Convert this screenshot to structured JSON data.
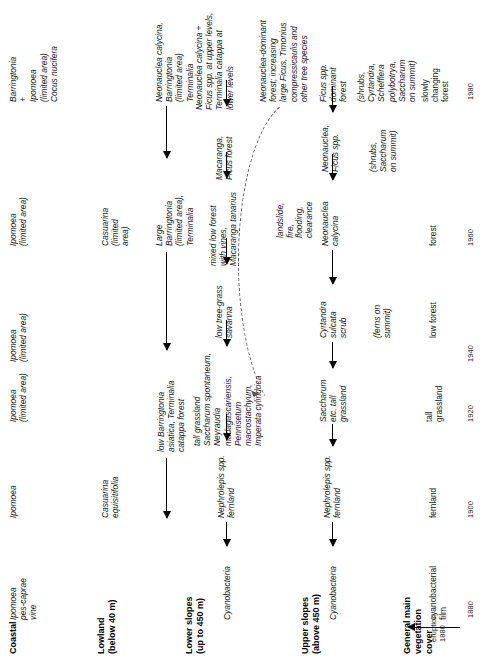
{
  "figure": {
    "orientation": "rotated-90ccw",
    "zone_headers": [
      "Coastal",
      "Lowland\n(below 40 m)",
      "Lower slopes\n(up to 450 m)",
      "Upper slopes\n(above 450 m)",
      "General main\nvegetation\ncover"
    ],
    "years": [
      "1880",
      "1900",
      "1920",
      "1940",
      "1960",
      "1980"
    ],
    "eruption_label": "eruption\n1880"
  },
  "cells": {
    "coastal_1880": "Ipomoea\npes-caprae\nvine",
    "coastal_1900": "Ipomoea",
    "coastal_1920": "Ipomoea\n(limited area)",
    "coastal_1940": "Ipomoea\n(limited area)",
    "coastal_1960": "Ipomoea\n(limited area)",
    "coastal_1980": "Barringtonia\n+\nIpomoea\n(limited area)\nCocus nucifera",
    "lowland_1900": "Casuarina\nequisitifolia",
    "lowland_1920": "low Barringtonia\nasiatica, Terminalia\ncatappa forest",
    "lowland_1960": "Casuarina\n(limited\narea)",
    "lowland_1960b": "Large\nBarringtonia\n(limited area),\nTerminalia",
    "lowland_1980": "Neonauclea calycina,\nBarringtonia\n(limited area)\nTerminalia",
    "lower_1880": "Cyanobacteria",
    "lower_1900": "Nephrolepis spp.\nfernland",
    "lower_1920": "tall grassland\nSaccharum spontaneum,\nNeyraudia\nmadagascariensis,\nPennisetum\nmacrostachyum,\nImperata cylindrica",
    "lower_1940": "low tree-grass\nsavanna",
    "lower_1950": "mixed low forest\nwith vines,\nMacaranga tanarius",
    "lower_1960": "Macaranga,\nFicus forest",
    "lower_1970": "Neonauclea calycina +\nFicus spp. at upper levels,\nTerminalia catappa at\nlower levels",
    "lower_1980": "Neonauclea-dominant\nforest; increasing\nlarge Ficus, Timonius\ncompressicaulis and\nother tree species",
    "upper_1880": "Cyanobacteria",
    "upper_1900": "Nephrolepis spp.\nfernland",
    "upper_1920": "Saccharum\netc. tall\ngrassland",
    "upper_1940": "Cyrtandra\nsulcata\nscrub",
    "upper_1960": "Neonauclea\ncalycina",
    "upper_1970": "Neonauclea,\nFicus spp.",
    "upper_1980": "Ficus spp.\ndominant\nforest",
    "cover_1880": "cyanobacterial\nfilm",
    "cover_1900": "fernland",
    "cover_1920": "tall\ngrassland",
    "cover_1940": "low forest",
    "cover_1960": "forest",
    "cover_1980": "slowly\nchanging\nforest",
    "note_ferns_summit": "(ferns on\nsummit)",
    "note_shrubs_summit": "(shrubs,\nSaccharum\non summit)",
    "note_shrubs_full": "(shrubs,\nCyrtandra,\nSchefflera\npolybotrya,\nSaccharum\non summit)",
    "disturbance": "landslide,\nfire,\nflooding,\nclearance"
  }
}
